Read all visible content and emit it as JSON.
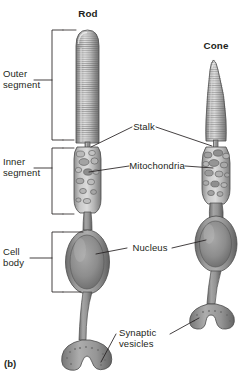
{
  "figure": {
    "caption": "(b)",
    "background_color": "#ffffff",
    "ink_color": "#231f20",
    "cell_fill_light": "#d8d8d8",
    "cell_fill_mid": "#9d9d9d",
    "cell_fill_dark": "#6e6e6e"
  },
  "titles": {
    "rod": "Rod",
    "cone": "Cone"
  },
  "left_labels": [
    {
      "id": "outer-segment",
      "text": "Outer\nsegment"
    },
    {
      "id": "inner-segment",
      "text": "Inner\nsegment"
    },
    {
      "id": "cell-body",
      "text": "Cell\nbody"
    }
  ],
  "callouts": [
    {
      "id": "stalk",
      "text": "Stalk"
    },
    {
      "id": "mitochondria",
      "text": "Mitochondria"
    },
    {
      "id": "nucleus",
      "text": "Nucleus"
    },
    {
      "id": "synaptic-vesicles",
      "text": "Synaptic\nvesicles"
    }
  ],
  "structures": {
    "rod": {
      "outer_segment": "cylindrical striated outer segment",
      "stalk": "connecting cilium stalk",
      "inner_segment": "inner segment with mitochondria",
      "nucleus": "oval nucleus in cell body",
      "synaptic_terminal": "spherule with synaptic vesicles"
    },
    "cone": {
      "outer_segment": "tapered conical striated outer segment",
      "stalk": "connecting cilium stalk",
      "inner_segment": "inner segment with mitochondria",
      "nucleus": "oval nucleus in cell body",
      "synaptic_terminal": "pedicle with synaptic vesicles"
    }
  }
}
